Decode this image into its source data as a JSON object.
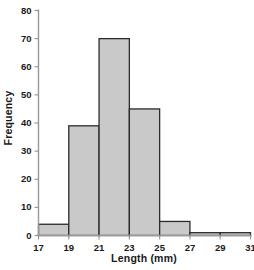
{
  "chart_data": {
    "type": "bar",
    "title": "",
    "subtitle": "",
    "xlabel": "Length (mm)",
    "ylabel": "Frequency",
    "xlim": [
      17,
      31
    ],
    "ylim": [
      0,
      80
    ],
    "grid": false,
    "legend": null,
    "bin_width": 2,
    "bin_edges": [
      17,
      19,
      21,
      23,
      25,
      27,
      29,
      31
    ],
    "categories": [
      "17-19",
      "19-21",
      "21-23",
      "23-25",
      "25-27",
      "27-29",
      "29-31"
    ],
    "values": [
      4,
      39,
      70,
      45,
      5,
      1,
      1
    ],
    "x_ticks": [
      17,
      19,
      21,
      23,
      25,
      27,
      29,
      31
    ],
    "x_tick_labels": [
      "17",
      "19",
      "21",
      "23",
      "25",
      "27",
      "29",
      "31"
    ],
    "y_ticks": [
      0,
      10,
      20,
      30,
      40,
      50,
      60,
      70,
      80
    ],
    "y_tick_labels": [
      "0",
      "10",
      "20",
      "30",
      "40",
      "50",
      "60",
      "70",
      "80"
    ],
    "bar_fill_color": "#c9c9c9",
    "bar_edge_color": "#2b2b2b",
    "axis_color": "#9a9a9a",
    "text_color": "#1a1a1a",
    "background_color": "#ffffff"
  }
}
